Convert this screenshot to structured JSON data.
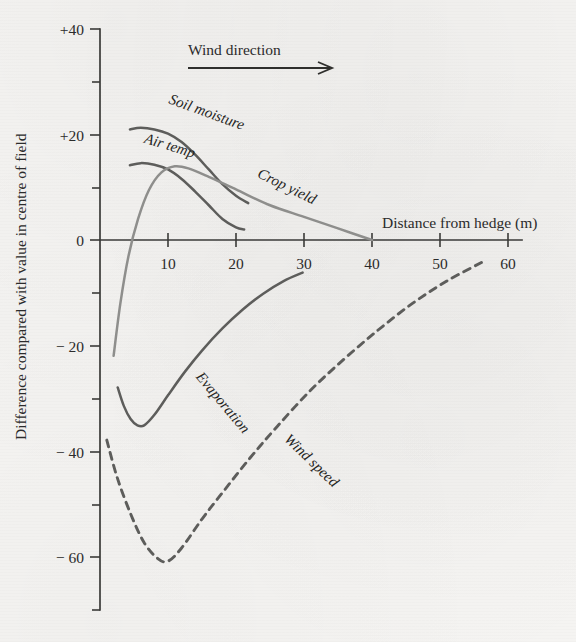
{
  "chart_data": {
    "type": "line",
    "title": "",
    "xlabel": "Distance from hedge (m)",
    "ylabel": "Difference compared with value in centre of field",
    "xlim": [
      0,
      62
    ],
    "ylim": [
      -70,
      40
    ],
    "xticks": [
      10,
      20,
      30,
      40,
      50,
      60
    ],
    "xtick_labels": [
      "10",
      "20",
      "30",
      "40",
      "50",
      "60"
    ],
    "yticks": [
      40,
      20,
      0,
      -20,
      -40,
      -60
    ],
    "ytick_labels": [
      "+40",
      "+20",
      "0",
      "− 20",
      "− 40",
      "− 60"
    ],
    "yminor_ticks": [
      30,
      10,
      -10,
      -30,
      -50,
      -70
    ],
    "grid": false,
    "legend_position": "inline-curve-labels",
    "annotations": [
      {
        "name": "wind-direction",
        "text": "Wind direction",
        "type": "arrow-right",
        "x_start": 13,
        "x_end": 42,
        "y": 33
      }
    ],
    "series": [
      {
        "name": "Soil moisture",
        "style": "solid",
        "color": "#5d5d5b",
        "label_x": 10,
        "label_y": 26,
        "label_rotation": 20,
        "x": [
          4.4,
          6,
          8,
          10,
          12,
          14,
          16,
          18,
          20,
          21.8
        ],
        "y": [
          21.0,
          21.3,
          21.0,
          20.2,
          18.6,
          16.2,
          13.4,
          10.6,
          8.4,
          7.0
        ]
      },
      {
        "name": "Air temp",
        "style": "solid",
        "color": "#5d5d5b",
        "label_x": 6.4,
        "label_y": 18.5,
        "label_rotation": 17,
        "x": [
          4.4,
          6,
          8,
          10,
          12,
          14,
          16,
          18,
          20,
          21.2
        ],
        "y": [
          14.2,
          14.6,
          14.3,
          13.4,
          11.6,
          9.2,
          6.6,
          4.0,
          2.4,
          2.0
        ]
      },
      {
        "name": "Crop yield",
        "style": "solid",
        "color": "#8e8e8c",
        "label_x": 23,
        "label_y": 12,
        "label_rotation": 26,
        "x": [
          2.0,
          3.0,
          4.2,
          5.6,
          7.2,
          9.0,
          11.0,
          13.0,
          16.0,
          20.0,
          25.0,
          30.0,
          35.0,
          40.0
        ],
        "y": [
          -22.0,
          -12.0,
          -3.0,
          4.0,
          9.5,
          12.8,
          14.0,
          13.6,
          12.0,
          9.6,
          6.6,
          4.4,
          2.2,
          0.0
        ]
      },
      {
        "name": "Evaporation",
        "style": "solid",
        "color": "#5d5d5b",
        "label_x": 14,
        "label_y": -26,
        "label_rotation": 50,
        "x": [
          2.6,
          3.5,
          4.5,
          5.5,
          6.5,
          8.0,
          10.0,
          12.5,
          15.0,
          18.0,
          21.0,
          24.0,
          27.0,
          29.8
        ],
        "y": [
          -28.0,
          -31.5,
          -34.0,
          -35.2,
          -35.2,
          -33.2,
          -29.5,
          -25.0,
          -21.0,
          -16.8,
          -13.2,
          -10.2,
          -7.8,
          -6.2
        ]
      },
      {
        "name": "Wind speed",
        "style": "dashed",
        "color": "#5d5d5b",
        "label_x": 27,
        "label_y": -38,
        "label_rotation": 44,
        "x": [
          1.0,
          2.5,
          4.5,
          6.5,
          8.5,
          10.0,
          12.0,
          15.0,
          18.0,
          22.0,
          26.0,
          31.0,
          36.0,
          41.0,
          46.0,
          51.0,
          56.5
        ],
        "y": [
          -38.0,
          -45.0,
          -52.0,
          -57.5,
          -60.5,
          -61.0,
          -58.5,
          -53.0,
          -48.0,
          -41.5,
          -35.5,
          -28.5,
          -22.5,
          -17.0,
          -12.0,
          -7.8,
          -4.0
        ]
      }
    ]
  }
}
